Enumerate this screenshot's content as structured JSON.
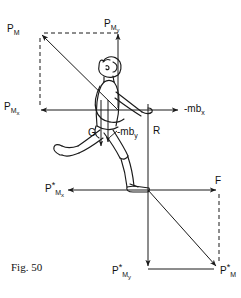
{
  "figure": {
    "caption": "Fig. 50"
  },
  "labels": {
    "p_m_top": {
      "base": "P",
      "sub": "M",
      "star": ""
    },
    "p_my_top": {
      "base": "P",
      "sub": "M",
      "sub2": "y",
      "star": ""
    },
    "p_mx_left": {
      "base": "P",
      "sub": "M",
      "sub2": "x",
      "star": ""
    },
    "mb_x_right": {
      "text": "-mb",
      "sub": "x"
    },
    "g_center": {
      "text": "G"
    },
    "mb_y_center": {
      "text": "-mb",
      "sub": "y"
    },
    "r_vertical": {
      "text": "R"
    },
    "p_mx_star_left": {
      "base": "P",
      "sub": "M",
      "sub2": "x",
      "star": "*"
    },
    "f_right": {
      "text": "F"
    },
    "p_my_star_bottom": {
      "base": "P",
      "sub": "M",
      "sub2": "y",
      "star": "*"
    },
    "p_m_star_bottom": {
      "base": "P",
      "sub": "M",
      "star": "*"
    }
  },
  "colors": {
    "ink": "#1a1a1a",
    "background": "#ffffff"
  },
  "geometry": {
    "upper_origin": {
      "x": 118,
      "y": 110
    },
    "upper_vector_tip": {
      "x": 40,
      "y": 33
    },
    "lower_origin": {
      "x": 148,
      "y": 190
    },
    "lower_vector_tip": {
      "x": 219,
      "y": 269
    }
  }
}
